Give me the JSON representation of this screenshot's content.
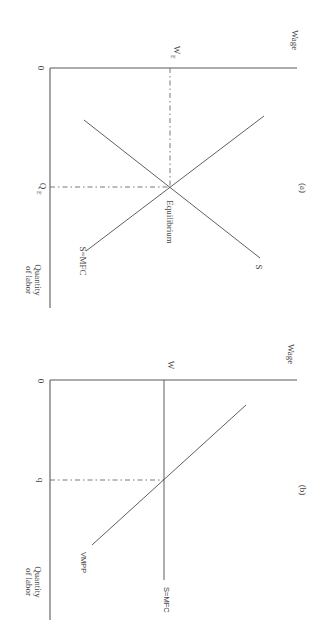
{
  "figure": {
    "orientation": "rotated 90 degrees clockwise",
    "panels": [
      {
        "id": "a",
        "caption": "(a)",
        "y_axis_label": "Wage",
        "x_axis_label_line1": "Quantity",
        "x_axis_label_line2": "of labor",
        "origin_label": "0",
        "wage_marker": "W",
        "wage_marker_sub": "E",
        "quantity_marker": "Q",
        "quantity_marker_sub": "E",
        "curves": [
          {
            "label": "S",
            "type": "supply",
            "slope": "upward"
          },
          {
            "label": "D",
            "type": "demand",
            "slope": "downward"
          }
        ],
        "annotation": "Equilibrium"
      },
      {
        "id": "b",
        "caption": "(b)",
        "y_axis_label": "Wage",
        "x_axis_label_line1": "Quantity",
        "x_axis_label_line2": "of labor",
        "origin_label": "0",
        "wage_marker": "W",
        "quantity_marker": "q",
        "curves": [
          {
            "label": "S=MFC",
            "type": "horizontal supply / marginal factor cost"
          },
          {
            "label": "VMPP",
            "type": "value of marginal physical product",
            "slope": "downward"
          }
        ]
      }
    ],
    "colors": {
      "line": "#4d4d4d",
      "text": "#444444",
      "background": "#ffffff"
    }
  }
}
